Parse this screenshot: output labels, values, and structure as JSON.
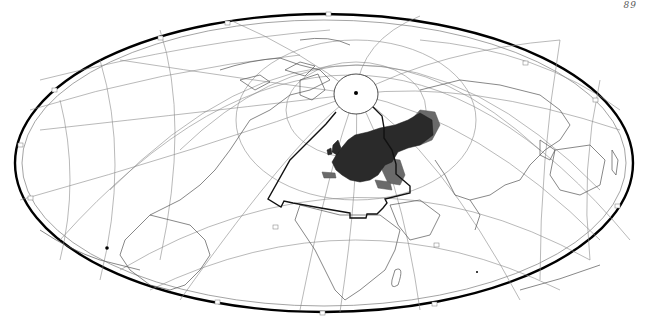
{
  "page": {
    "page_number": "89"
  },
  "map": {
    "projection": "oblique equal-area (Hammer/Aitoff-type) world map",
    "pole_marker": "north-pole-dot",
    "features": [
      {
        "name": "distribution-range-core",
        "description": "dark shaded range over Europe and western Russia",
        "color": "#2a2a2a"
      },
      {
        "name": "distribution-range-peripheral",
        "description": "lighter grey shaded range at margins (Urals, Black Sea, Caspian, Iberia coast)",
        "color": "#6a6a6a"
      },
      {
        "name": "study-area-outline",
        "description": "bold polygon outline enclosing N Atlantic, Europe, N Africa and Middle East",
        "color": "#111111"
      }
    ],
    "colors": {
      "frame": "#000000",
      "graticule": "#8a8a8a",
      "coastline": "#555555",
      "background": "#ffffff"
    }
  }
}
